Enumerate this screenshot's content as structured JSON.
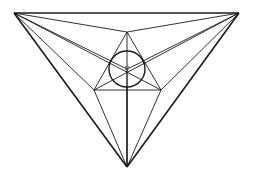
{
  "diagram": {
    "stroke_color": "#1a1a1a",
    "background": "#ffffff",
    "outer_triangle": {
      "A": [
        14,
        13
      ],
      "B": [
        239,
        13
      ],
      "C": [
        127,
        167
      ]
    },
    "inner_triangle": {
      "P": [
        127,
        32
      ],
      "Q": [
        94,
        90
      ],
      "R": [
        161,
        90
      ]
    },
    "circle": {
      "cx": 127,
      "cy": 69,
      "r": 18
    },
    "center": [
      127,
      69
    ]
  }
}
